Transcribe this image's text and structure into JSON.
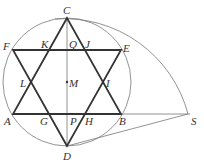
{
  "diagram": {
    "colors": {
      "thick": "#333333",
      "thin": "#777777",
      "label": "#333333"
    },
    "labels": {
      "C": "C",
      "F": "F",
      "K": "K",
      "Q": "Q",
      "J": "J",
      "E": "E",
      "L": "L",
      "M": "M",
      "I": "I",
      "A": "A",
      "G": "G",
      "P": "P",
      "H": "H",
      "B": "B",
      "S": "S",
      "D": "D"
    }
  }
}
